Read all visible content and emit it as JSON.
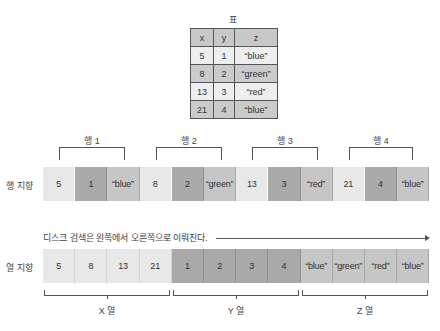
{
  "table": {
    "title": "표",
    "headers": [
      "x",
      "y",
      "z"
    ],
    "rows": [
      [
        "5",
        "1",
        "“blue”"
      ],
      [
        "8",
        "2",
        "“green”"
      ],
      [
        "13",
        "3",
        "“red”"
      ],
      [
        "21",
        "4",
        "“blue”"
      ]
    ]
  },
  "row_oriented": {
    "label": "행 지향",
    "groups": [
      "행 1",
      "행 2",
      "행 3",
      "행 4"
    ],
    "cells": [
      "5",
      "1",
      "“blue”",
      "8",
      "2",
      "“green”",
      "13",
      "3",
      "“red”",
      "21",
      "4",
      "“blue”"
    ]
  },
  "disk_scan_note": "디스크 검색은 왼쪽에서 오른쪽으로 이뤄진다.",
  "column_oriented": {
    "label": "열 지향",
    "groups": [
      "X 열",
      "Y 열",
      "Z 열"
    ],
    "cells": [
      "5",
      "8",
      "13",
      "21",
      "1",
      "2",
      "3",
      "4",
      "“blue”",
      "“green”",
      "“red”",
      "“blue”"
    ]
  },
  "colors": {
    "x_cell": "#e8e8e8",
    "y_cell": "#a9a9a9",
    "z_cell": "#c6c6c6",
    "table_header": "#c8c8c8"
  }
}
